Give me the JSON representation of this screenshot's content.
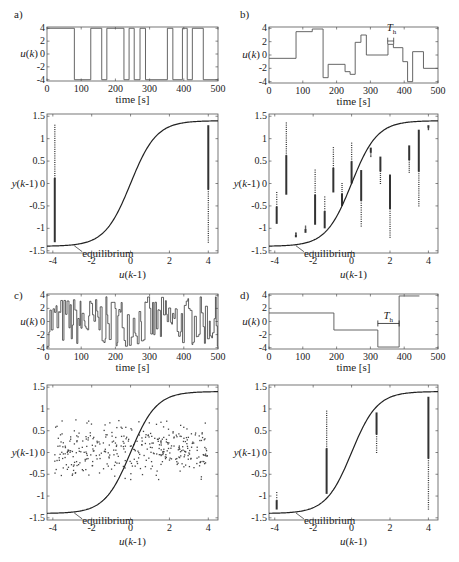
{
  "figure": {
    "caption": "",
    "colors": {
      "axes": "#555555",
      "curve": "#222222",
      "signal": "#555555",
      "points": "#333333",
      "background": "#ffffff"
    }
  },
  "panels": [
    {
      "letter": "a)",
      "top_ylabel": "u(k)",
      "top_xlabel": "time  [s]",
      "bottom_ylabel": "y(k-1)",
      "bottom_xlabel": "u(k-1)",
      "annotation": "equilibrium"
    },
    {
      "letter": "b)",
      "top_ylabel": "u(k)",
      "top_xlabel": "time  [s]",
      "bottom_ylabel": "y(k-1)",
      "bottom_xlabel": "u(k-1)",
      "annotation": "equilibrium",
      "hold_label": "T_h"
    },
    {
      "letter": "c)",
      "top_ylabel": "u(k)",
      "top_xlabel": "time  [s]",
      "bottom_ylabel": "y(k-1)",
      "bottom_xlabel": "u(k-1)",
      "annotation": "equilibrium"
    },
    {
      "letter": "d)",
      "top_ylabel": "u(k)",
      "top_xlabel": "time  [s]",
      "bottom_ylabel": "y(k-1)",
      "bottom_xlabel": "u(k-1)",
      "annotation": "equilibrium",
      "hold_label": "T_h"
    }
  ],
  "chart_data": [
    {
      "panel": "a-top",
      "type": "line",
      "title": "",
      "xlabel": "time [s]",
      "ylabel": "u(k)",
      "xlim": [
        0,
        500
      ],
      "ylim": [
        -4.2,
        4.2
      ],
      "xticks": [
        0,
        100,
        200,
        300,
        400,
        500
      ],
      "yticks": [
        -4,
        -2,
        0,
        2,
        4
      ],
      "series": [
        {
          "name": "u(k) APRBS (two-level)",
          "steps": [
            [
              0,
              4
            ],
            [
              80,
              -4
            ],
            [
              128,
              4
            ],
            [
              160,
              -4
            ],
            [
              175,
              4
            ],
            [
              225,
              -4
            ],
            [
              240,
              4
            ],
            [
              255,
              -4
            ],
            [
              272,
              4
            ],
            [
              288,
              -4
            ],
            [
              352,
              4
            ],
            [
              368,
              -4
            ],
            [
              396,
              4
            ],
            [
              410,
              -4
            ],
            [
              425,
              4
            ],
            [
              457,
              -4
            ],
            [
              500,
              -4
            ]
          ]
        }
      ]
    },
    {
      "panel": "a-bottom",
      "type": "scatter",
      "xlabel": "u(k-1)",
      "ylabel": "y(k-1)",
      "xlim": [
        -4.3,
        4.5
      ],
      "ylim": [
        -1.55,
        1.55
      ],
      "xticks": [
        -4,
        -2,
        0,
        2,
        4
      ],
      "yticks": [
        -1.5,
        -1,
        -0.5,
        0,
        0.5,
        1,
        1.5
      ],
      "curve": {
        "name": "equilibrium",
        "formula": "y = 1.4*tanh(0.75*u)"
      },
      "series": [
        {
          "name": "data",
          "clusters": [
            {
              "u": -3.9,
              "ymin": -1.31,
              "ymax": 1.3
            },
            {
              "u": 4.0,
              "ymin": -1.31,
              "ymax": 1.3
            }
          ]
        }
      ],
      "annotations": [
        "equilibrium"
      ]
    },
    {
      "panel": "b-top",
      "type": "line",
      "xlabel": "time [s]",
      "ylabel": "u(k)",
      "xlim": [
        0,
        500
      ],
      "ylim": [
        -4.2,
        4.2
      ],
      "xticks": [
        0,
        100,
        200,
        300,
        400,
        500
      ],
      "yticks": [
        -4,
        -2,
        0,
        2,
        4
      ],
      "series": [
        {
          "name": "u(k) APRBS (multi-level)",
          "steps": [
            [
              0,
              -0.5
            ],
            [
              80,
              3.5
            ],
            [
              128,
              3.9
            ],
            [
              160,
              -3.4
            ],
            [
              175,
              -1.4
            ],
            [
              225,
              -2.5
            ],
            [
              240,
              -2.9
            ],
            [
              255,
              1.9
            ],
            [
              272,
              3
            ],
            [
              288,
              0
            ],
            [
              352,
              1.6
            ],
            [
              368,
              1.1
            ],
            [
              396,
              -1
            ],
            [
              410,
              -4
            ],
            [
              425,
              0.5
            ],
            [
              457,
              -2
            ],
            [
              500,
              -2
            ]
          ]
        }
      ],
      "annotations": [
        {
          "text": "T_h",
          "x": 360
        }
      ]
    },
    {
      "panel": "b-bottom",
      "type": "scatter",
      "xlabel": "u(k-1)",
      "ylabel": "y(k-1)",
      "xlim": [
        -4.3,
        4.5
      ],
      "ylim": [
        -1.55,
        1.55
      ],
      "xticks": [
        -4,
        -2,
        0,
        2,
        4
      ],
      "yticks": [
        -1.5,
        -1,
        -0.5,
        0,
        0.5,
        1,
        1.5
      ],
      "curve": {
        "name": "equilibrium",
        "formula": "y = 1.4*tanh(0.75*u)"
      },
      "series": [
        {
          "name": "data",
          "clusters": [
            {
              "u": -3.9,
              "ymin": -0.9,
              "ymax": -0.2
            },
            {
              "u": -3.4,
              "ymin": -0.25,
              "ymax": 1.35
            },
            {
              "u": -2.9,
              "ymin": -1.2,
              "ymax": -1.1
            },
            {
              "u": -2.4,
              "ymin": -1.1,
              "ymax": -0.95
            },
            {
              "u": -1.9,
              "ymin": -0.92,
              "ymax": 0.3
            },
            {
              "u": -1.4,
              "ymin": -1.0,
              "ymax": -0.3
            },
            {
              "u": -0.95,
              "ymin": -0.2,
              "ymax": 0.8
            },
            {
              "u": -0.5,
              "ymin": -0.5,
              "ymax": 0.0
            },
            {
              "u": 0.0,
              "ymin": 0.0,
              "ymax": 0.9
            },
            {
              "u": 0.5,
              "ymin": -0.95,
              "ymax": 0.3
            },
            {
              "u": 1.0,
              "ymin": 0.6,
              "ymax": 0.8
            },
            {
              "u": 1.5,
              "ymin": 0.0,
              "ymax": 0.6
            },
            {
              "u": 2.0,
              "ymin": -1.2,
              "ymax": 0.2
            },
            {
              "u": 3.0,
              "ymin": 0.25,
              "ymax": 0.85
            },
            {
              "u": 3.5,
              "ymin": -0.5,
              "ymax": 1.2
            },
            {
              "u": 4.0,
              "ymin": 1.2,
              "ymax": 1.3
            }
          ]
        }
      ],
      "annotations": [
        "equilibrium"
      ]
    },
    {
      "panel": "c-top",
      "type": "line",
      "xlabel": "time [s]",
      "ylabel": "u(k)",
      "xlim": [
        0,
        500
      ],
      "ylim": [
        -4.2,
        4.2
      ],
      "xticks": [
        0,
        100,
        200,
        300,
        400,
        500
      ],
      "yticks": [
        -4,
        -2,
        0,
        2,
        4
      ],
      "series": [
        {
          "name": "u(k) white-noise-like",
          "description": "random step signal, amplitude within [-4, 4], change roughly every 3-5 s"
        }
      ]
    },
    {
      "panel": "c-bottom",
      "type": "scatter",
      "xlabel": "u(k-1)",
      "ylabel": "y(k-1)",
      "xlim": [
        -4.3,
        4.5
      ],
      "ylim": [
        -1.55,
        1.55
      ],
      "xticks": [
        -4,
        -2,
        0,
        2,
        4
      ],
      "yticks": [
        -1.5,
        -1,
        -0.5,
        0,
        0.5,
        1,
        1.5
      ],
      "curve": {
        "name": "equilibrium",
        "formula": "y = 1.4*tanh(0.75*u)"
      },
      "series": [
        {
          "name": "data",
          "description": "points spread over u in [-3.9, 4], y mostly in [-0.6, 0.75]"
        }
      ],
      "annotations": [
        "equilibrium"
      ]
    },
    {
      "panel": "d-top",
      "type": "line",
      "xlabel": "time [s]",
      "ylabel": "u(k)",
      "xlim": [
        0,
        500
      ],
      "ylim": [
        -4.2,
        4.2
      ],
      "xticks": [
        0,
        100,
        200,
        300,
        400,
        500
      ],
      "yticks": [
        -4,
        -2,
        0,
        2,
        4
      ],
      "series": [
        {
          "name": "u(k) slow multi-level",
          "steps": [
            [
              0,
              1.3
            ],
            [
              192,
              -1.3
            ],
            [
              322,
              -3.9
            ],
            [
              385,
              3.9
            ],
            [
              445,
              3.9
            ]
          ]
        }
      ],
      "annotations": [
        {
          "text": "T_h",
          "x_from": 322,
          "x_to": 385
        }
      ]
    },
    {
      "panel": "d-bottom",
      "type": "scatter",
      "xlabel": "u(k-1)",
      "ylabel": "y(k-1)",
      "xlim": [
        -4.3,
        4.5
      ],
      "ylim": [
        -1.55,
        1.55
      ],
      "xticks": [
        -4,
        -2,
        0,
        2,
        4
      ],
      "yticks": [
        -1.5,
        -1,
        -0.5,
        0,
        0.5,
        1,
        1.5
      ],
      "curve": {
        "name": "equilibrium",
        "formula": "y = 1.4*tanh(0.75*u)"
      },
      "series": [
        {
          "name": "data",
          "clusters": [
            {
              "u": -3.9,
              "ymin": -1.31,
              "ymax": -0.92
            },
            {
              "u": -1.3,
              "ymin": -0.95,
              "ymax": 0.95
            },
            {
              "u": 1.3,
              "ymin": 0.0,
              "ymax": 0.92
            },
            {
              "u": 4.0,
              "ymin": -1.3,
              "ymax": 1.28
            }
          ]
        }
      ],
      "annotations": [
        "equilibrium"
      ]
    }
  ]
}
